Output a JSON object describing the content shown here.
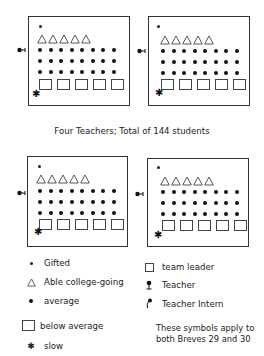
{
  "caption": "Four Teachers; Total of 144 students",
  "rooms": [
    {
      "id": "top-left",
      "gifted": 1,
      "able_college_going": 5,
      "average": 24,
      "below_average": 5,
      "slow": 1,
      "teacher": "Teacher"
    },
    {
      "id": "top-right",
      "gifted": 1,
      "able_college_going": 5,
      "average": 24,
      "below_average": 5,
      "slow": 1,
      "teacher": "Teacher"
    },
    {
      "id": "bottom-left",
      "gifted": 1,
      "able_college_going": 5,
      "average": 24,
      "below_average": 5,
      "slow": 1,
      "teacher": "Teacher"
    },
    {
      "id": "bottom-right",
      "gifted": 1,
      "able_college_going": 5,
      "average": 24,
      "below_average": 5,
      "slow": 1,
      "teacher": "Teacher"
    }
  ],
  "legend": {
    "gifted": "Gifted",
    "able": "Able college-going",
    "average": "average",
    "below_average": "below average",
    "slow": "slow",
    "team_leader": "team leader",
    "teacher": "Teacher",
    "teacher_intern": "Teacher Intern",
    "note_line1": "These symbols apply to",
    "note_line2": "both Breves 29 and 30"
  },
  "icons": {
    "slow": "✱"
  }
}
